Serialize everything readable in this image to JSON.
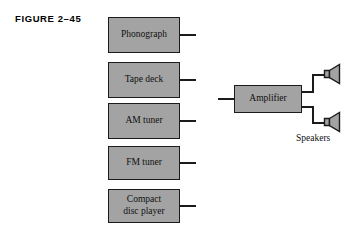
{
  "figure": {
    "label": "FIGURE 2–45",
    "colors": {
      "block_fill": "#a3a3a3",
      "block_stroke": "#1b1b1b",
      "background": "#ffffff",
      "text": "#101010"
    }
  },
  "sources": [
    {
      "id": "phonograph",
      "label": "Phonograph"
    },
    {
      "id": "tape-deck",
      "label": "Tape deck"
    },
    {
      "id": "am-tuner",
      "label": "AM tuner"
    },
    {
      "id": "fm-tuner",
      "label": "FM tuner"
    },
    {
      "id": "compact-disc-player",
      "label": "Compact\ndisc player"
    }
  ],
  "amplifier": {
    "label": "Amplifier"
  },
  "speakers": {
    "caption": "Speakers",
    "count": 2,
    "icon": "speaker-icon"
  }
}
